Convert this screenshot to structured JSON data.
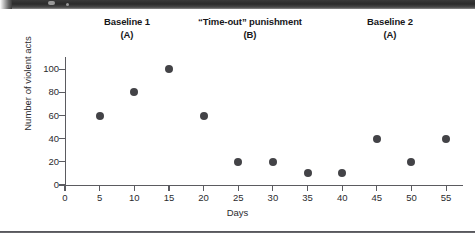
{
  "decor": {
    "top_band_name": "page-edge-band",
    "bottom_rule_name": "figure-bottom-rule"
  },
  "phases": [
    {
      "label": "Baseline 1",
      "sub": "(A)"
    },
    {
      "label": "“Time-out” punishment",
      "sub": "(B)"
    },
    {
      "label": "Baseline 2",
      "sub": "(A)"
    }
  ],
  "chart_data": {
    "type": "scatter",
    "title": "",
    "xlabel": "Days",
    "ylabel": "Number of violent acts",
    "xlim": [
      0,
      57
    ],
    "ylim": [
      0,
      108
    ],
    "grid": false,
    "legend": "none",
    "xticks": [
      0,
      5,
      10,
      15,
      20,
      25,
      30,
      35,
      40,
      45,
      50,
      55
    ],
    "xtick_labels": [
      "0",
      "5",
      "10",
      "15",
      "20",
      "25",
      "30",
      "35",
      "40",
      "45",
      "50",
      "55"
    ],
    "yticks": [
      0,
      20,
      40,
      60,
      80,
      100
    ],
    "ytick_labels": [
      "0",
      "20",
      "40",
      "60",
      "80",
      "100"
    ],
    "marker": "filled-circle",
    "marker_color": "#434347",
    "x": [
      5,
      10,
      15,
      20,
      25,
      30,
      35,
      40,
      45,
      50,
      55
    ],
    "y": [
      60,
      80,
      100,
      60,
      20,
      20,
      10,
      10,
      40,
      20,
      40
    ],
    "phase_annotations": [
      {
        "label": "Baseline 1",
        "sub": "(A)",
        "x_range": [
          0,
          22.5
        ]
      },
      {
        "label": "“Time-out” punishment",
        "sub": "(B)",
        "x_range": [
          22.5,
          42.5
        ]
      },
      {
        "label": "Baseline 2",
        "sub": "(A)",
        "x_range": [
          42.5,
          57
        ]
      }
    ]
  }
}
